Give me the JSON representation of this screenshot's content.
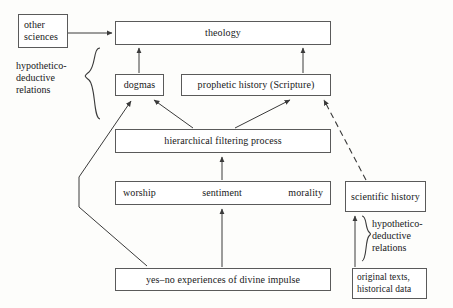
{
  "diagram": {
    "nodes": {
      "other_sciences": "other\nsciences",
      "theology": "theology",
      "dogmas": "dogmas",
      "prophetic_history": "prophetic history (Scripture)",
      "hierarchical_filtering": "hierarchical filtering process",
      "worship": "worship",
      "sentiment": "sentiment",
      "morality": "morality",
      "scientific_history": "scientific\nhistory",
      "yes_no_experiences": "yes–no experiences of divine impulse",
      "original_texts": "original texts,\nhistorical data"
    },
    "annotations": {
      "hypothetico_deductive_left": "hypothetico-\ndeductive\nrelations",
      "hypothetico_deductive_right": "hypothetico-\ndeductive\nrelations"
    },
    "edges": [
      {
        "from": "other_sciences",
        "to": "theology",
        "style": "solid",
        "direction": "right"
      },
      {
        "from": "dogmas",
        "to": "theology",
        "style": "solid",
        "direction": "up"
      },
      {
        "from": "prophetic_history",
        "to": "theology",
        "style": "solid",
        "direction": "up"
      },
      {
        "from": "hierarchical_filtering",
        "to": "dogmas",
        "style": "solid",
        "direction": "up-left"
      },
      {
        "from": "hierarchical_filtering",
        "to": "prophetic_history",
        "style": "solid",
        "direction": "up-right"
      },
      {
        "from": "worship_row",
        "to": "hierarchical_filtering",
        "style": "solid",
        "direction": "up"
      },
      {
        "from": "yes_no_experiences",
        "to": "worship_row",
        "style": "solid",
        "direction": "up"
      },
      {
        "from": "yes_no_experiences",
        "to": "dogmas",
        "style": "solid",
        "direction": "polyline-left"
      },
      {
        "from": "scientific_history",
        "to": "prophetic_history",
        "style": "dashed",
        "direction": "up-left"
      },
      {
        "from": "original_texts",
        "to": "scientific_history",
        "style": "solid",
        "direction": "up"
      }
    ],
    "colors": {
      "stroke": "#3a3a3a",
      "box_border": "#5a5a5a",
      "background": "#fdfdfb",
      "text": "#18181a"
    }
  }
}
